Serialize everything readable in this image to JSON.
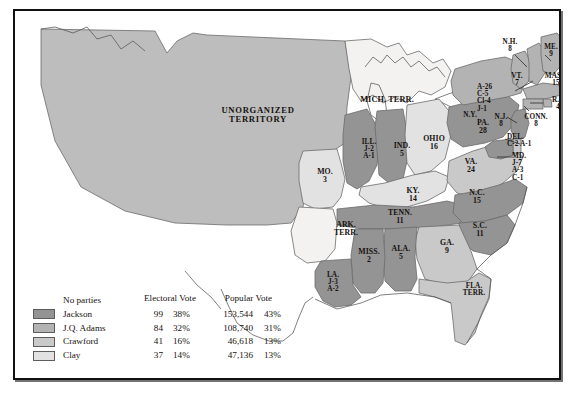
{
  "map": {
    "title_region": "United States presidential election of 1824",
    "territories": [
      {
        "name": "UNORGANIZED TERRITORY",
        "lines": [
          "UNORGANIZED",
          "TERRITORY"
        ]
      },
      {
        "name": "MICH. TERR.",
        "lines": [
          "MICH. TERR."
        ]
      },
      {
        "name": "ARK. TERR.",
        "lines": [
          "ARK.",
          "TERR."
        ]
      },
      {
        "name": "FLA. TERR.",
        "lines": [
          "FLA.",
          "TERR."
        ]
      }
    ],
    "states": [
      {
        "abbr": "MO.",
        "lines": [
          "MO.",
          "3"
        ],
        "party": "clay"
      },
      {
        "abbr": "ILL.",
        "lines": [
          "ILL.",
          "J-2",
          "A-1"
        ],
        "party": "jackson"
      },
      {
        "abbr": "IND.",
        "lines": [
          "IND.",
          "5"
        ],
        "party": "jackson"
      },
      {
        "abbr": "OHIO",
        "lines": [
          "OHIO",
          "16"
        ],
        "party": "clay"
      },
      {
        "abbr": "KY.",
        "lines": [
          "KY.",
          "14"
        ],
        "party": "clay"
      },
      {
        "abbr": "TENN.",
        "lines": [
          "TENN.",
          "11"
        ],
        "party": "jackson"
      },
      {
        "abbr": "MISS.",
        "lines": [
          "MISS.",
          "2"
        ],
        "party": "jackson"
      },
      {
        "abbr": "ALA.",
        "lines": [
          "ALA.",
          "5"
        ],
        "party": "jackson"
      },
      {
        "abbr": "LA.",
        "lines": [
          "LA.",
          "J-3",
          "A-2"
        ],
        "party": "jackson"
      },
      {
        "abbr": "GA.",
        "lines": [
          "GA.",
          "9"
        ],
        "party": "crawford"
      },
      {
        "abbr": "S.C.",
        "lines": [
          "S.C.",
          "11"
        ],
        "party": "jackson"
      },
      {
        "abbr": "N.C.",
        "lines": [
          "N.C.",
          "15"
        ],
        "party": "jackson"
      },
      {
        "abbr": "VA.",
        "lines": [
          "VA.",
          "24"
        ],
        "party": "crawford"
      },
      {
        "abbr": "MD.",
        "lines": [
          "MD.",
          "J-7",
          "A-3",
          "C-1"
        ],
        "party": "jackson"
      },
      {
        "abbr": "DEL.",
        "lines": [
          "DEL.",
          "C-2 A-1"
        ],
        "party": "crawford"
      },
      {
        "abbr": "PA.",
        "lines": [
          "PA.",
          "28"
        ],
        "party": "jackson"
      },
      {
        "abbr": "N.J.",
        "lines": [
          "N.J.",
          "8"
        ],
        "party": "jackson"
      },
      {
        "abbr": "N.Y.",
        "lines": [
          "N.Y."
        ],
        "party": "adams"
      },
      {
        "abbr": "N.Y. split",
        "lines": [
          "A-26",
          "C-5",
          "Cl-4",
          "J-1"
        ],
        "party": "adams"
      },
      {
        "abbr": "CONN.",
        "lines": [
          "CONN.",
          "8"
        ],
        "party": "adams"
      },
      {
        "abbr": "R.I.",
        "lines": [
          "R.I.",
          "4"
        ],
        "party": "adams"
      },
      {
        "abbr": "MASS.",
        "lines": [
          "MASS.",
          "15"
        ],
        "party": "adams"
      },
      {
        "abbr": "VT.",
        "lines": [
          "VT.",
          "7"
        ],
        "party": "adams"
      },
      {
        "abbr": "N.H.",
        "lines": [
          "N.H.",
          "8"
        ],
        "party": "adams"
      },
      {
        "abbr": "ME.",
        "lines": [
          "ME.",
          "9"
        ],
        "party": "adams"
      }
    ],
    "state_labels": {
      "unorganized_l1": "UNORGANIZED",
      "unorganized_l2": "TERRITORY",
      "mich_terr": "MICH. TERR.",
      "ark_terr_l1": "ARK.",
      "ark_terr_l2": "TERR.",
      "fla_terr_l1": "FLA.",
      "fla_terr_l2": "TERR.",
      "mo_l1": "MO.",
      "mo_l2": "3",
      "ill_l1": "ILL.",
      "ill_l2": "J-2",
      "ill_l3": "A-1",
      "ind_l1": "IND.",
      "ind_l2": "5",
      "ohio_l1": "OHIO",
      "ohio_l2": "16",
      "ky_l1": "KY.",
      "ky_l2": "14",
      "tenn_l1": "TENN.",
      "tenn_l2": "11",
      "miss_l1": "MISS.",
      "miss_l2": "2",
      "ala_l1": "ALA.",
      "ala_l2": "5",
      "la_l1": "LA.",
      "la_l2": "J-3",
      "la_l3": "A-2",
      "ga_l1": "GA.",
      "ga_l2": "9",
      "sc_l1": "S.C.",
      "sc_l2": "11",
      "nc_l1": "N.C.",
      "nc_l2": "15",
      "va_l1": "VA.",
      "va_l2": "24",
      "md_l1": "MD.",
      "md_l2": "J-7",
      "md_l3": "A-3",
      "md_l4": "C-1",
      "del_l1": "DEL.",
      "del_l2": "C-2 A-1",
      "pa_l1": "PA.",
      "pa_l2": "28",
      "nj_l1": "N.J.",
      "nj_l2": "8",
      "ny_l1": "N.Y.",
      "ny_a": "A-26",
      "ny_c": "C-5",
      "ny_cl": "Cl-4",
      "ny_j": "J-1",
      "conn_l1": "CONN.",
      "conn_l2": "8",
      "ri_l1": "R.I.",
      "ri_l2": "4",
      "mass_l1": "MASS.",
      "mass_l2": "15",
      "vt_l1": "VT.",
      "vt_l2": "7",
      "nh_l1": "N.H.",
      "nh_l2": "8",
      "me_l1": "ME.",
      "me_l2": "9"
    }
  },
  "legend": {
    "note": "No parties",
    "headers": {
      "electoral_l1": "Electoral",
      "electoral_l2": "Vote",
      "popular_l1": "Popular",
      "popular_l2": "Vote"
    },
    "rows": [
      {
        "candidate": "Jackson",
        "electoral_vote": "99",
        "electoral_pct": "38%",
        "popular_vote": "153,544",
        "popular_pct": "43%",
        "color": "#949494"
      },
      {
        "candidate": "J.Q. Adams",
        "electoral_vote": "84",
        "electoral_pct": "32%",
        "popular_vote": "108,740",
        "popular_pct": "31%",
        "color": "#b3b3b3"
      },
      {
        "candidate": "Crawford",
        "electoral_vote": "41",
        "electoral_pct": "16%",
        "popular_vote": "46,618",
        "popular_pct": "13%",
        "color": "#c9c9c9"
      },
      {
        "candidate": "Clay",
        "electoral_vote": "37",
        "electoral_pct": "14%",
        "popular_vote": "47,136",
        "popular_pct": "13%",
        "color": "#e2e2e2"
      }
    ]
  },
  "colors": {
    "jackson": "#949494",
    "adams": "#b3b3b3",
    "crawford": "#c9c9c9",
    "clay": "#e2e2e2",
    "unorganized": "#bdbdbd",
    "territory_light": "#f1f0ee",
    "outline": "#6b6b6b",
    "border": "#111111",
    "background": "#ffffff"
  }
}
